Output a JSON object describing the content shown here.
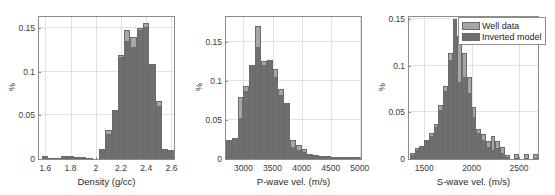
{
  "figure": {
    "panel_count": 3,
    "legend": {
      "position": "top-right-of-third-panel",
      "entries": [
        {
          "label": "Well data",
          "color": "#a6a6a6"
        },
        {
          "label": "Inverted model",
          "color": "#6f6f6f"
        }
      ]
    }
  },
  "chart_data": [
    {
      "type": "bar",
      "title": "",
      "xlabel": "Density (g/cc)",
      "ylabel": "%",
      "xlim": [
        1.55,
        2.62
      ],
      "ylim": [
        0,
        0.163
      ],
      "xticks": [
        1.6,
        1.8,
        2.0,
        2.2,
        2.4,
        2.6
      ],
      "xtick_labels": [
        "1.6",
        "1.8",
        "2",
        "2.2",
        "2.4",
        "2.6"
      ],
      "yticks": [
        0,
        0.05,
        0.1,
        0.15
      ],
      "ytick_labels": [
        "0",
        "0.05",
        "0.1",
        "0.15"
      ],
      "grid": true,
      "bin_centers": [
        1.6,
        1.65,
        1.7,
        1.75,
        1.8,
        1.85,
        1.9,
        1.95,
        2.0,
        2.05,
        2.1,
        2.15,
        2.2,
        2.25,
        2.3,
        2.35,
        2.4,
        2.45,
        2.5,
        2.55,
        2.6
      ],
      "series": [
        {
          "name": "Well data",
          "values": [
            0.003,
            0.001,
            0.001,
            0.003,
            0.003,
            0.002,
            0.002,
            0.001,
            0.0,
            0.011,
            0.033,
            0.056,
            0.119,
            0.148,
            0.14,
            0.15,
            0.156,
            0.109,
            0.067,
            0.012,
            0.01
          ]
        },
        {
          "name": "Inverted model",
          "values": [
            0.003,
            0.001,
            0.001,
            0.003,
            0.003,
            0.002,
            0.002,
            0.001,
            0.0,
            0.011,
            0.029,
            0.056,
            0.117,
            0.136,
            0.129,
            0.148,
            0.152,
            0.109,
            0.061,
            0.012,
            0.01
          ]
        }
      ]
    },
    {
      "type": "bar",
      "title": "",
      "xlabel": "P-wave vel. (m/s)",
      "ylabel": "%",
      "xlim": [
        2700,
        5020
      ],
      "ylim": [
        0,
        0.182
      ],
      "xticks": [
        3000,
        3500,
        4000,
        4500,
        5000
      ],
      "xtick_labels": [
        "3000",
        "3500",
        "4000",
        "4500",
        "5000"
      ],
      "yticks": [
        0,
        0.05,
        0.1,
        0.15
      ],
      "ytick_labels": [
        "0",
        "0.05",
        "0.1",
        "0.15"
      ],
      "grid": true,
      "bin_centers": [
        2750,
        2850,
        2950,
        3050,
        3150,
        3250,
        3350,
        3450,
        3550,
        3650,
        3750,
        3850,
        3950,
        4050,
        4150,
        4250,
        4350,
        4450,
        4550,
        4650,
        4750,
        4850,
        4950
      ],
      "series": [
        {
          "name": "Well data",
          "values": [
            0.025,
            0.027,
            0.079,
            0.094,
            0.12,
            0.17,
            0.126,
            0.127,
            0.116,
            0.09,
            0.072,
            0.025,
            0.018,
            0.013,
            0.006,
            0.005,
            0.004,
            0.004,
            0.002,
            0.002,
            0.002,
            0.002,
            0.002
          ]
        },
        {
          "name": "Inverted model",
          "values": [
            0.025,
            0.027,
            0.053,
            0.087,
            0.12,
            0.143,
            0.12,
            0.127,
            0.105,
            0.082,
            0.072,
            0.016,
            0.012,
            0.009,
            0.005,
            0.004,
            0.003,
            0.003,
            0.002,
            0.001,
            0.001,
            0.001,
            0.002
          ]
        }
      ]
    },
    {
      "type": "bar",
      "title": "",
      "xlabel": "S-wave vel. (m/s)",
      "ylabel": "%",
      "xlim": [
        1340,
        2700
      ],
      "ylim": [
        0,
        0.152
      ],
      "xticks": [
        1500,
        2000,
        2500
      ],
      "xtick_labels": [
        "1500",
        "2000",
        "2500"
      ],
      "yticks": [
        0,
        0.05,
        0.1,
        0.15
      ],
      "ytick_labels": [
        "0",
        "0.05",
        "0.1",
        "0.15"
      ],
      "grid": true,
      "bin_centers": [
        1375,
        1425,
        1475,
        1525,
        1575,
        1625,
        1675,
        1725,
        1775,
        1825,
        1875,
        1925,
        1975,
        2025,
        2075,
        2125,
        2175,
        2225,
        2275,
        2325,
        2375,
        2475,
        2575,
        2675
      ],
      "series": [
        {
          "name": "Well data",
          "values": [
            0.006,
            0.012,
            0.014,
            0.02,
            0.028,
            0.037,
            0.058,
            0.078,
            0.114,
            0.15,
            0.132,
            0.113,
            0.088,
            0.056,
            0.032,
            0.027,
            0.019,
            0.025,
            0.019,
            0.013,
            0.004,
            0.005,
            0.005,
            0.005
          ]
        },
        {
          "name": "Inverted model",
          "values": [
            0.004,
            0.01,
            0.013,
            0.019,
            0.025,
            0.034,
            0.053,
            0.073,
            0.106,
            0.15,
            0.082,
            0.088,
            0.071,
            0.045,
            0.028,
            0.02,
            0.013,
            0.01,
            0.012,
            0.006,
            0.002,
            0.001,
            0.001,
            0.001
          ]
        }
      ]
    }
  ]
}
